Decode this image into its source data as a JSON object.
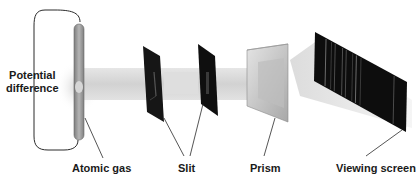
{
  "diagram": {
    "labels": {
      "potential_difference_line1": "Potential",
      "potential_difference_line2": "difference",
      "atomic_gas": "Atomic gas",
      "slit": "Slit",
      "prism": "Prism",
      "viewing_screen": "Viewing screen"
    },
    "colors": {
      "beam": "#d8d8d8",
      "slit_plate": "#151515",
      "screen": "#0d0d0d",
      "spectral_line": "#8a8a8a",
      "wire": "#2a2a2a",
      "tube": "#9a9a9a",
      "prism": "#c4c4c4"
    },
    "spectral_lines": [
      0.12,
      0.18,
      0.22,
      0.3,
      0.34,
      0.41,
      0.45,
      0.5,
      0.86
    ]
  }
}
